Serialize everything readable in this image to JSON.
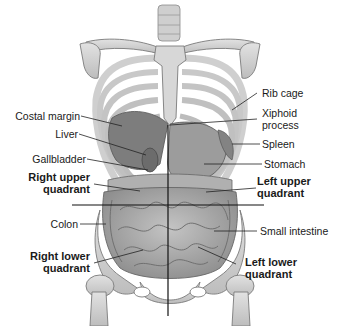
{
  "diagram": {
    "colors": {
      "bone": "#d4d4d4",
      "organ": "#8a8a8a",
      "intestine": "#b5b5b5",
      "line": "#111111",
      "text": "#1a1a1a"
    },
    "labels_left": [
      {
        "id": "costal-margin",
        "text": "Costal margin"
      },
      {
        "id": "liver",
        "text": "Liver"
      },
      {
        "id": "gallbladder",
        "text": "Gallbladder"
      },
      {
        "id": "right-upper-quadrant",
        "text_1": "Right upper",
        "text_2": "quadrant"
      },
      {
        "id": "colon",
        "text": "Colon"
      },
      {
        "id": "right-lower-quadrant",
        "text_1": "Right lower",
        "text_2": "quadrant"
      }
    ],
    "labels_right": [
      {
        "id": "rib-cage",
        "text": "Rib cage"
      },
      {
        "id": "xiphoid-process",
        "text_1": "Xiphoid",
        "text_2": "process"
      },
      {
        "id": "spleen",
        "text": "Spleen"
      },
      {
        "id": "stomach",
        "text": "Stomach"
      },
      {
        "id": "left-upper-quadrant",
        "text_1": "Left upper",
        "text_2": "quadrant"
      },
      {
        "id": "small-intestine",
        "text": "Small intestine"
      },
      {
        "id": "left-lower-quadrant",
        "text_1": "Left lower",
        "text_2": "quadrant"
      }
    ]
  }
}
